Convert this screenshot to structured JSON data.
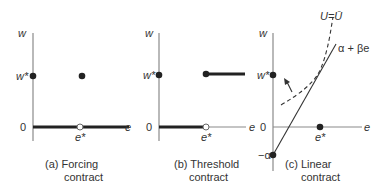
{
  "figure": {
    "panels": [
      {
        "id": "a",
        "caption_line1": "(a)  Forcing",
        "caption_line2": "contract",
        "y_axis_label": "w",
        "x_axis_label": "e",
        "w_star_label": "w*",
        "zero_label": "0",
        "e_star_label": "e*"
      },
      {
        "id": "b",
        "caption_line1": "(b)  Threshold",
        "caption_line2": "contract",
        "y_axis_label": "w",
        "x_axis_label": "e",
        "w_star_label": "w*",
        "zero_label": "0",
        "e_star_label": "e*"
      },
      {
        "id": "c",
        "caption_line1": "(c)  Linear",
        "caption_line2": "contract",
        "y_axis_label": "w",
        "x_axis_label": "e",
        "w_star_label": "w*",
        "zero_label": "0",
        "e_star_label": "e*",
        "neg_alpha_label": "−α",
        "line_label": "α + βe",
        "curve_label": "U=Ū"
      }
    ],
    "colors": {
      "axis": "#8a8a8a",
      "ink": "#222222",
      "text": "#333333"
    }
  }
}
